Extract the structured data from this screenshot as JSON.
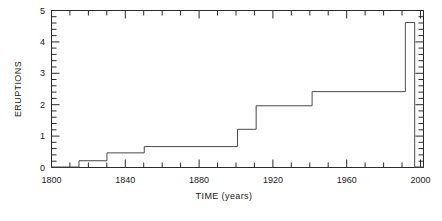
{
  "chart_data": {
    "type": "area",
    "title": "",
    "subtitle": "",
    "xlabel": "TIME (years)",
    "ylabel": "ERUPTIONS",
    "xlim": [
      1800,
      2000
    ],
    "ylim": [
      0,
      5
    ],
    "grid": false,
    "legend": null,
    "x_ticks_major": [
      1800,
      1840,
      1880,
      1920,
      1960,
      2000
    ],
    "x_tick_labels": [
      "1800",
      "1840",
      "1880",
      "1920",
      "1960",
      "2000"
    ],
    "x_minor_interval": 10,
    "y_ticks_major": [
      0,
      1,
      2,
      3,
      4,
      5
    ],
    "y_tick_labels": [
      "0",
      "1",
      "2",
      "3",
      "4",
      "5"
    ],
    "y_minor_interval": 0.2,
    "series": [
      {
        "name": "Eruptions",
        "style": "step-histogram",
        "steps": [
          {
            "x_start": 1800,
            "x_end": 1815,
            "value": 0.0
          },
          {
            "x_start": 1815,
            "x_end": 1830,
            "value": 0.2
          },
          {
            "x_start": 1830,
            "x_end": 1850,
            "value": 0.45
          },
          {
            "x_start": 1850,
            "x_end": 1900,
            "value": 0.65
          },
          {
            "x_start": 1900,
            "x_end": 1910,
            "value": 1.2
          },
          {
            "x_start": 1910,
            "x_end": 1940,
            "value": 1.95
          },
          {
            "x_start": 1940,
            "x_end": 1990,
            "value": 2.4
          },
          {
            "x_start": 1990,
            "x_end": 1995,
            "value": 4.6
          },
          {
            "x_start": 1995,
            "x_end": 2000,
            "value": 0.0
          }
        ]
      }
    ],
    "annotations": []
  },
  "axes": {
    "y_axis_label": "ERUPTIONS",
    "x_axis_label": "TIME (years)",
    "y_labels": [
      "5",
      "4",
      "3",
      "2",
      "1",
      "0"
    ],
    "x_labels": [
      "1800",
      "1840",
      "1880",
      "1920",
      "1960",
      "2000"
    ]
  },
  "colors": {
    "line": "#4a4a4a",
    "frame": "#2b2b2b",
    "text": "#1a1a1a",
    "background": "#ffffff"
  }
}
